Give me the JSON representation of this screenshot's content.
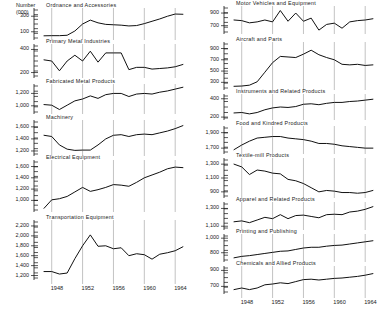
{
  "figure": {
    "units_label": "Number\n(000)",
    "x_ticks": [
      "1948",
      "1952",
      "1956",
      "1960",
      "1964"
    ],
    "axis_color": "#111111",
    "grid_color": "#9a9a9a",
    "line_color": "#111111",
    "background": "#ffffff"
  },
  "chart_data": [
    {
      "type": "line",
      "title": "Ordnance and Accessories",
      "xlabel": "",
      "ylabel": "Number (000)",
      "x": [
        1947,
        1948,
        1949,
        1950,
        1951,
        1952,
        1953,
        1954,
        1955,
        1956,
        1957,
        1958,
        1959,
        1960,
        1961,
        1962,
        1963,
        1964,
        1965
      ],
      "values": [
        48,
        50,
        50,
        55,
        110,
        200,
        250,
        215,
        195,
        190,
        185,
        175,
        180,
        205,
        235,
        265,
        300,
        328,
        325
      ],
      "yticks": [
        100,
        300
      ],
      "ylim": [
        20,
        380
      ],
      "grid": true,
      "legend": "none"
    },
    {
      "type": "line",
      "title": "Primary Metal Industries",
      "xlabel": "",
      "ylabel": "Number (000)",
      "x": [
        1947,
        1948,
        1949,
        1950,
        1951,
        1952,
        1953,
        1954,
        1955,
        1956,
        1957,
        1958,
        1959,
        1960,
        1961,
        1962,
        1963,
        1964,
        1965
      ],
      "values": [
        310,
        300,
        215,
        300,
        350,
        300,
        385,
        290,
        370,
        370,
        370,
        225,
        245,
        245,
        230,
        235,
        240,
        250,
        270
      ],
      "yticks": [
        200,
        400
      ],
      "ylim": [
        170,
        430
      ],
      "grid": true,
      "legend": "none"
    },
    {
      "type": "line",
      "title": "Fabricated Metal Products",
      "xlabel": "",
      "ylabel": "Number (000)",
      "x": [
        1947,
        1948,
        1949,
        1950,
        1951,
        1952,
        1953,
        1954,
        1955,
        1956,
        1957,
        1958,
        1959,
        1960,
        1961,
        1962,
        1963,
        1964,
        1965
      ],
      "values": [
        1020,
        1010,
        940,
        1010,
        1080,
        1110,
        1160,
        1120,
        1180,
        1200,
        1200,
        1150,
        1190,
        1200,
        1190,
        1220,
        1240,
        1270,
        1300
      ],
      "yticks": [
        1000,
        1200
      ],
      "ylim": [
        900,
        1320
      ],
      "grid": true,
      "legend": "none"
    },
    {
      "type": "line",
      "title": "Machinery",
      "xlabel": "",
      "ylabel": "Number (000)",
      "x": [
        1947,
        1948,
        1949,
        1950,
        1951,
        1952,
        1953,
        1954,
        1955,
        1956,
        1957,
        1958,
        1959,
        1960,
        1961,
        1962,
        1963,
        1964,
        1965
      ],
      "values": [
        1460,
        1440,
        1300,
        1230,
        1210,
        1215,
        1215,
        1300,
        1400,
        1460,
        1470,
        1440,
        1470,
        1480,
        1470,
        1500,
        1530,
        1570,
        1620
      ],
      "yticks": [
        1200,
        1400,
        1600
      ],
      "ylim": [
        1150,
        1680
      ],
      "grid": true,
      "legend": "none"
    },
    {
      "type": "line",
      "title": "Electrical Equipment",
      "xlabel": "",
      "ylabel": "Number (000)",
      "x": [
        1947,
        1948,
        1949,
        1950,
        1951,
        1952,
        1953,
        1954,
        1955,
        1956,
        1957,
        1958,
        1959,
        1960,
        1961,
        1962,
        1963,
        1964,
        1965
      ],
      "values": [
        860,
        1010,
        1030,
        1070,
        1150,
        1230,
        1160,
        1190,
        1230,
        1280,
        1270,
        1250,
        1320,
        1400,
        1450,
        1500,
        1560,
        1590,
        1580
      ],
      "yticks": [
        1000,
        1200,
        1400,
        1600
      ],
      "ylim": [
        830,
        1680
      ],
      "grid": true,
      "legend": "none"
    },
    {
      "type": "line",
      "title": "Transportation Equipment",
      "xlabel": "",
      "ylabel": "Number (000)",
      "x": [
        1947,
        1948,
        1949,
        1950,
        1951,
        1952,
        1953,
        1954,
        1955,
        1956,
        1957,
        1958,
        1959,
        1960,
        1961,
        1962,
        1963,
        1964,
        1965
      ],
      "values": [
        1280,
        1280,
        1230,
        1250,
        1540,
        1800,
        2020,
        1790,
        1800,
        1740,
        1760,
        1600,
        1640,
        1620,
        1530,
        1630,
        1660,
        1700,
        1780
      ],
      "yticks": [
        1200,
        1400,
        1600,
        1800,
        2000,
        2200
      ],
      "ylim": [
        1150,
        2280
      ],
      "grid": true,
      "legend": "none"
    },
    {
      "type": "line",
      "title": "Motor Vehicles and Equipment",
      "xlabel": "",
      "ylabel": "Number (000)",
      "x": [
        1947,
        1948,
        1949,
        1950,
        1951,
        1952,
        1953,
        1954,
        1955,
        1956,
        1957,
        1958,
        1959,
        1960,
        1961,
        1962,
        1963,
        1964,
        1965
      ],
      "values": [
        790,
        780,
        745,
        760,
        790,
        760,
        940,
        770,
        900,
        770,
        820,
        630,
        720,
        740,
        660,
        760,
        780,
        790,
        810
      ],
      "yticks": [
        700,
        900
      ],
      "ylim": [
        600,
        980
      ],
      "grid": true,
      "legend": "none"
    },
    {
      "type": "line",
      "title": "Aircraft and Parts",
      "xlabel": "",
      "ylabel": "Number (000)",
      "x": [
        1947,
        1948,
        1949,
        1950,
        1951,
        1952,
        1953,
        1954,
        1955,
        1956,
        1957,
        1958,
        1959,
        1960,
        1961,
        1962,
        1963,
        1964,
        1965
      ],
      "values": [
        230,
        235,
        250,
        310,
        480,
        650,
        760,
        750,
        740,
        800,
        870,
        790,
        740,
        700,
        620,
        610,
        620,
        600,
        610
      ],
      "yticks": [
        300,
        500,
        700,
        900
      ],
      "ylim": [
        200,
        980
      ],
      "grid": true,
      "legend": "none"
    },
    {
      "type": "line",
      "title": "Instruments and Related Products",
      "xlabel": "",
      "ylabel": "Number (000)",
      "x": [
        1947,
        1948,
        1949,
        1950,
        1951,
        1952,
        1953,
        1954,
        1955,
        1956,
        1957,
        1958,
        1959,
        1960,
        1961,
        1962,
        1963,
        1964,
        1965
      ],
      "values": [
        245,
        250,
        235,
        250,
        280,
        300,
        310,
        305,
        315,
        340,
        345,
        335,
        350,
        360,
        360,
        370,
        375,
        385,
        395
      ],
      "yticks": [
        200,
        400
      ],
      "ylim": [
        190,
        430
      ],
      "grid": true,
      "legend": "none"
    },
    {
      "type": "line",
      "title": "Food and Kindred Products",
      "xlabel": "",
      "ylabel": "Number (000)",
      "x": [
        1947,
        1948,
        1949,
        1950,
        1951,
        1952,
        1953,
        1954,
        1955,
        1956,
        1957,
        1958,
        1959,
        1960,
        1961,
        1962,
        1963,
        1964,
        1965
      ],
      "values": [
        1680,
        1740,
        1790,
        1830,
        1840,
        1850,
        1850,
        1830,
        1820,
        1810,
        1790,
        1760,
        1760,
        1750,
        1730,
        1720,
        1710,
        1700,
        1700
      ],
      "yticks": [
        1700,
        1900
      ],
      "ylim": [
        1650,
        1960
      ],
      "grid": true,
      "legend": "none"
    },
    {
      "type": "line",
      "title": "Textile-mill Products",
      "xlabel": "",
      "ylabel": "Number (000)",
      "x": [
        1947,
        1948,
        1949,
        1950,
        1951,
        1952,
        1953,
        1954,
        1955,
        1956,
        1957,
        1958,
        1959,
        1960,
        1961,
        1962,
        1963,
        1964,
        1965
      ],
      "values": [
        1300,
        1260,
        1150,
        1215,
        1200,
        1170,
        1160,
        1080,
        1060,
        1020,
        960,
        900,
        920,
        910,
        890,
        890,
        880,
        890,
        920
      ],
      "yticks": [
        900,
        1100,
        1300
      ],
      "ylim": [
        840,
        1360
      ],
      "grid": true,
      "legend": "none"
    },
    {
      "type": "line",
      "title": "Apparel and Related Products",
      "xlabel": "",
      "ylabel": "Number (000)",
      "x": [
        1947,
        1948,
        1949,
        1950,
        1951,
        1952,
        1953,
        1954,
        1955,
        1956,
        1957,
        1958,
        1959,
        1960,
        1961,
        1962,
        1963,
        1964,
        1965
      ],
      "values": [
        1150,
        1160,
        1140,
        1170,
        1200,
        1185,
        1230,
        1185,
        1220,
        1225,
        1210,
        1195,
        1230,
        1235,
        1230,
        1260,
        1270,
        1290,
        1320
      ],
      "yticks": [
        1100,
        1300
      ],
      "ylim": [
        1080,
        1350
      ],
      "grid": true,
      "legend": "none"
    },
    {
      "type": "line",
      "title": "Printing and Publishing",
      "xlabel": "",
      "ylabel": "Number (000)",
      "x": [
        1947,
        1948,
        1949,
        1950,
        1951,
        1952,
        1953,
        1954,
        1955,
        1956,
        1957,
        1958,
        1959,
        1960,
        1961,
        1962,
        1963,
        1964,
        1965
      ],
      "values": [
        730,
        750,
        760,
        775,
        790,
        805,
        820,
        825,
        845,
        865,
        875,
        875,
        890,
        900,
        905,
        920,
        935,
        950,
        965
      ],
      "yticks": [
        800,
        1000
      ],
      "ylim": [
        700,
        1030
      ],
      "grid": true,
      "legend": "none"
    },
    {
      "type": "line",
      "title": "Chemicals and Allied Products",
      "xlabel": "",
      "ylabel": "Number (000)",
      "x": [
        1947,
        1948,
        1949,
        1950,
        1951,
        1952,
        1953,
        1954,
        1955,
        1956,
        1957,
        1958,
        1959,
        1960,
        1961,
        1962,
        1963,
        1964,
        1965
      ],
      "values": [
        660,
        680,
        660,
        680,
        720,
        730,
        745,
        735,
        760,
        785,
        790,
        780,
        790,
        800,
        805,
        815,
        825,
        840,
        860
      ],
      "yticks": [
        700,
        900
      ],
      "ylim": [
        630,
        930
      ],
      "grid": true,
      "legend": "none"
    }
  ]
}
